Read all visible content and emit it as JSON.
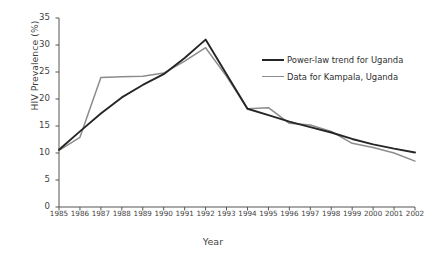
{
  "chart_data": {
    "type": "line",
    "title": "",
    "xlabel": "Year",
    "ylabel": "HIV Prevalence (%)",
    "x": [
      1985,
      1986,
      1987,
      1988,
      1989,
      1990,
      1991,
      1992,
      1993,
      1994,
      1995,
      1996,
      1997,
      1998,
      1999,
      2000,
      2001,
      2002
    ],
    "xtick_labels": [
      "1985",
      "1986",
      "1987",
      "1988",
      "1989",
      "1990",
      "1991",
      "1992",
      "1993",
      "1994",
      "1995",
      "1996",
      "1997",
      "1998",
      "1999",
      "2000",
      "2001",
      "2002"
    ],
    "ytick_labels": [
      "0",
      "5",
      "10",
      "15",
      "20",
      "25",
      "30",
      "35"
    ],
    "yticks": [
      0,
      5,
      10,
      15,
      20,
      25,
      30,
      35
    ],
    "xlim": [
      1985,
      2002
    ],
    "ylim": [
      0,
      35
    ],
    "grid": false,
    "legend_position": "upper right",
    "series": [
      {
        "name": "Power-law trend for Uganda",
        "color": "#262626",
        "width": 1.9,
        "values": [
          10.6,
          14.0,
          17.3,
          20.3,
          22.6,
          24.6,
          27.6,
          31.0,
          24.6,
          18.2,
          17.0,
          15.8,
          14.8,
          13.8,
          12.6,
          11.6,
          10.8,
          10.1
        ]
      },
      {
        "name": "Data for Kampala, Uganda",
        "color": "#8c8c8c",
        "width": 1.5,
        "values": [
          10.5,
          12.9,
          24.0,
          24.1,
          24.2,
          24.8,
          27.0,
          29.5,
          24.2,
          18.2,
          18.4,
          15.5,
          15.2,
          14.0,
          11.8,
          11.0,
          10.0,
          8.5
        ]
      }
    ]
  },
  "legend": {
    "entries": [
      {
        "label": "Power-law trend for Uganda",
        "color": "#262626",
        "thickness": "2.2px"
      },
      {
        "label": "Data for Kampala, Uganda",
        "color": "#8c8c8c",
        "thickness": "1.6px"
      }
    ]
  },
  "axis_color": "#555555"
}
